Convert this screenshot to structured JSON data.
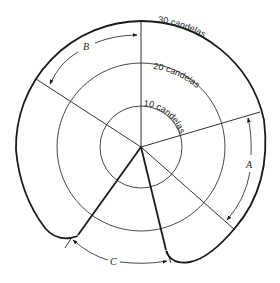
{
  "diagram": {
    "rings": [
      {
        "label": "10 candelas",
        "value": 10
      },
      {
        "label": "20 candelas",
        "value": 20
      },
      {
        "label": "30 candelas",
        "value": 30
      }
    ],
    "angle_labels": {
      "a": "A",
      "b": "B",
      "c": "C"
    },
    "colors": {
      "line": "#1a1a1a",
      "background": "#ffffff"
    }
  }
}
